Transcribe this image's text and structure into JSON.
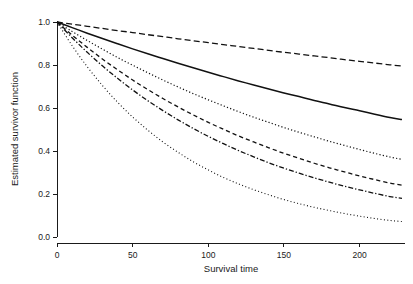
{
  "chart_data": {
    "type": "line",
    "title": "",
    "xlabel": "Survival time",
    "ylabel": "Estimated survivor function",
    "xlim": [
      0,
      230
    ],
    "ylim": [
      0.0,
      1.0
    ],
    "grid": false,
    "legend": "none",
    "xticks": [
      0,
      50,
      100,
      150,
      200
    ],
    "xtick_labels": [
      "0",
      "50",
      "100",
      "150",
      "200"
    ],
    "yticks": [
      0.0,
      0.2,
      0.4,
      0.6,
      0.8,
      1.0
    ],
    "ytick_labels": [
      "0.0",
      "0.2",
      "0.4",
      "0.6",
      "0.8",
      "1.0"
    ],
    "x": [
      0,
      10,
      20,
      30,
      40,
      50,
      60,
      70,
      80,
      90,
      100,
      110,
      120,
      130,
      140,
      150,
      160,
      170,
      180,
      190,
      200,
      210,
      220,
      228
    ],
    "series": [
      {
        "name": "curve-1-longdash",
        "style": "longdash",
        "color": "#111111",
        "values": [
          1.0,
          0.99,
          0.98,
          0.97,
          0.96,
          0.951,
          0.941,
          0.932,
          0.922,
          0.913,
          0.904,
          0.895,
          0.886,
          0.877,
          0.868,
          0.859,
          0.851,
          0.842,
          0.834,
          0.825,
          0.817,
          0.809,
          0.801,
          0.795
        ]
      },
      {
        "name": "curve-2-solid",
        "style": "solid",
        "color": "#111111",
        "values": [
          1.0,
          0.974,
          0.948,
          0.923,
          0.899,
          0.875,
          0.852,
          0.83,
          0.808,
          0.787,
          0.766,
          0.746,
          0.726,
          0.707,
          0.688,
          0.67,
          0.653,
          0.635,
          0.619,
          0.602,
          0.587,
          0.571,
          0.556,
          0.546
        ]
      },
      {
        "name": "curve-3-dotted",
        "style": "dotted",
        "color": "#111111",
        "values": [
          1.0,
          0.956,
          0.914,
          0.874,
          0.835,
          0.799,
          0.764,
          0.73,
          0.698,
          0.667,
          0.638,
          0.61,
          0.583,
          0.557,
          0.533,
          0.509,
          0.487,
          0.466,
          0.445,
          0.426,
          0.407,
          0.389,
          0.372,
          0.361
        ]
      },
      {
        "name": "curve-4-dashed",
        "style": "dashed",
        "color": "#111111",
        "values": [
          1.0,
          0.939,
          0.882,
          0.828,
          0.778,
          0.73,
          0.686,
          0.644,
          0.605,
          0.568,
          0.533,
          0.501,
          0.47,
          0.442,
          0.415,
          0.389,
          0.366,
          0.343,
          0.322,
          0.303,
          0.284,
          0.267,
          0.251,
          0.241
        ]
      },
      {
        "name": "curve-5-dashdot",
        "style": "dashdot",
        "color": "#111111",
        "values": [
          1.0,
          0.927,
          0.859,
          0.796,
          0.738,
          0.684,
          0.634,
          0.588,
          0.545,
          0.505,
          0.468,
          0.434,
          0.402,
          0.373,
          0.345,
          0.32,
          0.297,
          0.275,
          0.255,
          0.236,
          0.219,
          0.203,
          0.188,
          0.18
        ]
      },
      {
        "name": "curve-6-finedotted",
        "style": "finedotted",
        "color": "#111111",
        "values": [
          1.0,
          0.89,
          0.792,
          0.705,
          0.627,
          0.558,
          0.497,
          0.442,
          0.394,
          0.35,
          0.312,
          0.277,
          0.247,
          0.22,
          0.196,
          0.174,
          0.155,
          0.138,
          0.123,
          0.109,
          0.097,
          0.086,
          0.077,
          0.072
        ]
      }
    ]
  },
  "axes": {
    "x_label": "Survival time",
    "y_label": "Estimated survivor function"
  }
}
